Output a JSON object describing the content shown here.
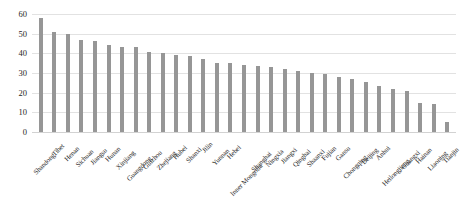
{
  "chart_data": {
    "type": "bar",
    "title": "",
    "xlabel": "",
    "ylabel": "",
    "ylim": [
      0,
      60
    ],
    "yticks": [
      0,
      10,
      20,
      30,
      40,
      50,
      60
    ],
    "grid": true,
    "legend": "none",
    "bar_color": "#969696",
    "gridline_color": "#e2e2e2",
    "categories": [
      "Shandong",
      "Tibet",
      "Henan",
      "Sichuan",
      "Jiangsu",
      "Hunan",
      "Xinjiang",
      "Guangdong",
      "Guizhou",
      "Zhejiang",
      "Hubei",
      "Shanxi",
      "Jilin",
      "Yunnan",
      "Hebei",
      "Inner Mongolia",
      "Shanghai",
      "Ningxia",
      "Jiangxi",
      "Qinghai",
      "Shaanxi",
      "Fujian",
      "Gansu",
      "Chongqing",
      "Beijing",
      "Anhui",
      "Heilongjiang",
      "Guangxi",
      "Hainan",
      "Liaoning",
      "Tianjin"
    ],
    "values": [
      58,
      51,
      50,
      47,
      46.5,
      44,
      43,
      43,
      40.5,
      40,
      39,
      38.5,
      37,
      35,
      35,
      34,
      33.5,
      33,
      32,
      31,
      30,
      29.5,
      28,
      27,
      25.5,
      23.5,
      22,
      21,
      15,
      14,
      5
    ]
  }
}
